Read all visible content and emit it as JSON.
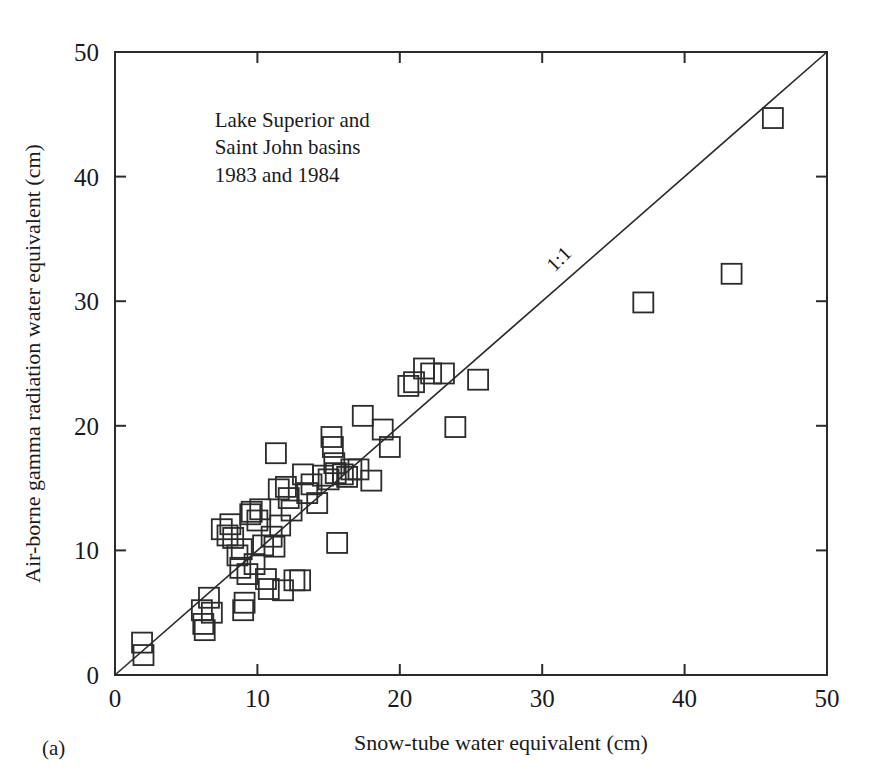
{
  "figure": {
    "panel_label": "(a)",
    "background": "#ffffff",
    "ink_color": "#2b2b2b"
  },
  "annotation": {
    "line1": "Lake Superior and",
    "line2": "Saint John basins",
    "line3": "1983 and 1984"
  },
  "reference_line": {
    "label": "1:1"
  },
  "chart_data": {
    "type": "scatter",
    "title": "",
    "subtitle": "",
    "xlabel": "Snow-tube water equivalent (cm)",
    "ylabel": "Air-borne gamma radiation water equivalent (cm)",
    "xlim": [
      0,
      50
    ],
    "ylim": [
      0,
      50
    ],
    "xticks": [
      0,
      10,
      20,
      30,
      40,
      50
    ],
    "yticks": [
      0,
      10,
      20,
      30,
      40,
      50
    ],
    "xticklabels": [
      "0",
      "10",
      "20",
      "30",
      "40",
      "50"
    ],
    "yticklabels": [
      "0",
      "10",
      "20",
      "30",
      "40",
      "50"
    ],
    "grid": false,
    "legend": null,
    "marker": "open-square",
    "annotations": [
      {
        "text": "Lake Superior and",
        "x": 7.0,
        "y": 44.0
      },
      {
        "text": "Saint John basins",
        "x": 7.0,
        "y": 41.8
      },
      {
        "text": "1983 and 1984",
        "x": 7.0,
        "y": 39.6
      },
      {
        "text": "1:1",
        "x": 31.5,
        "y": 33.0,
        "rotation": -45
      }
    ],
    "reference_lines": [
      {
        "name": "1:1",
        "x": [
          0,
          50
        ],
        "y": [
          0,
          50
        ]
      }
    ],
    "series": [
      {
        "name": "Lake Superior and Saint John basins 1983-1984",
        "points": [
          [
            1.9,
            2.6
          ],
          [
            2.0,
            1.6
          ],
          [
            6.1,
            5.2
          ],
          [
            6.2,
            4.1
          ],
          [
            6.3,
            3.6
          ],
          [
            6.6,
            6.2
          ],
          [
            6.8,
            5.0
          ],
          [
            7.5,
            11.7
          ],
          [
            7.9,
            11.2
          ],
          [
            8.1,
            12.1
          ],
          [
            8.3,
            11.0
          ],
          [
            8.6,
            9.6
          ],
          [
            8.8,
            8.6
          ],
          [
            8.9,
            10.1
          ],
          [
            9.0,
            5.2
          ],
          [
            9.1,
            5.8
          ],
          [
            9.3,
            8.1
          ],
          [
            9.5,
            12.9
          ],
          [
            9.6,
            13.1
          ],
          [
            9.8,
            8.9
          ],
          [
            10.0,
            12.4
          ],
          [
            10.2,
            13.3
          ],
          [
            10.4,
            10.4
          ],
          [
            10.6,
            7.7
          ],
          [
            10.8,
            6.9
          ],
          [
            11.0,
            11.1
          ],
          [
            11.2,
            10.3
          ],
          [
            11.3,
            17.8
          ],
          [
            11.5,
            14.9
          ],
          [
            11.6,
            12.0
          ],
          [
            11.8,
            6.8
          ],
          [
            12.0,
            15.1
          ],
          [
            12.2,
            14.2
          ],
          [
            12.4,
            13.2
          ],
          [
            12.6,
            7.6
          ],
          [
            13.0,
            7.6
          ],
          [
            13.2,
            16.1
          ],
          [
            13.5,
            14.6
          ],
          [
            13.8,
            15.3
          ],
          [
            14.2,
            13.8
          ],
          [
            14.6,
            16.0
          ],
          [
            15.0,
            15.7
          ],
          [
            15.2,
            19.1
          ],
          [
            15.3,
            18.3
          ],
          [
            15.4,
            17.0
          ],
          [
            15.5,
            16.2
          ],
          [
            15.6,
            10.6
          ],
          [
            16.0,
            16.1
          ],
          [
            16.3,
            15.9
          ],
          [
            16.6,
            16.5
          ],
          [
            17.1,
            16.5
          ],
          [
            17.4,
            20.8
          ],
          [
            18.0,
            15.6
          ],
          [
            18.8,
            19.7
          ],
          [
            19.3,
            18.3
          ],
          [
            20.6,
            23.2
          ],
          [
            21.0,
            23.5
          ],
          [
            21.7,
            24.6
          ],
          [
            22.2,
            24.2
          ],
          [
            23.1,
            24.2
          ],
          [
            23.9,
            19.9
          ],
          [
            25.5,
            23.7
          ],
          [
            37.1,
            29.9
          ],
          [
            43.3,
            32.2
          ],
          [
            46.2,
            44.7
          ]
        ]
      }
    ]
  }
}
